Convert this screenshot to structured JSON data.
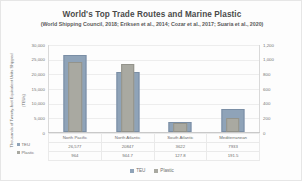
{
  "chart_data": {
    "type": "bar",
    "title": "World's Top Trade Routes and Marine Plastic",
    "subtitle": "(World Shipping Council, 2018; Eriksen et al., 2014; Cozar et al., 2017; Suaria et al., 2020)",
    "categories": [
      "North Pacific",
      "North Atlantic",
      "South Atlantic",
      "Mediterranean"
    ],
    "series": [
      {
        "name": "TEU",
        "axis": "left",
        "color": "#8fa3b8",
        "values": [
          26577,
          20847,
          3622,
          7933
        ],
        "display_values": [
          "26,577",
          "20847",
          "3622",
          "7933"
        ]
      },
      {
        "name": "Plastic",
        "axis": "right",
        "color": "#a9a9a1",
        "values": [
          964,
          944.7,
          127.8,
          191.5
        ],
        "display_values": [
          "964",
          "944.7",
          "127.8",
          "191.5"
        ]
      }
    ],
    "xlabel": "",
    "ylabel": "Thousands of Twenty-foot Equivalent Units Shipped",
    "ylabel2": "(TEUs)",
    "y2label": "Plastic Debris in 1,000 grams (Oranges)",
    "ylim": [
      0,
      30000
    ],
    "y2lim": [
      0,
      1200
    ],
    "yticks": [
      "30,000",
      "25,000",
      "20,000",
      "15,000",
      "10,000",
      "5,000",
      "0"
    ],
    "y2ticks": [
      "1,200",
      "1,000",
      "800",
      "600",
      "400",
      "200",
      "0"
    ],
    "grid": true,
    "legend_position": "bottom",
    "legend": [
      "TEU",
      "Plastic"
    ]
  }
}
